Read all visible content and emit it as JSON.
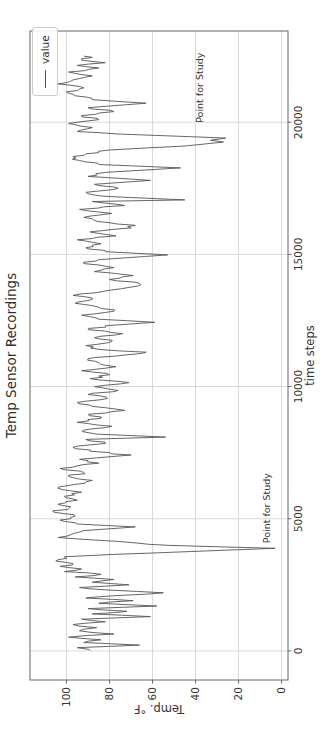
{
  "figure": {
    "background": "#ffffff"
  },
  "chart_data": {
    "type": "line",
    "title": "Temp Sensor Recordings",
    "xlabel": "time steps",
    "ylabel": "Temp. °F",
    "legend": {
      "label": "value",
      "position": "upper right"
    },
    "grid": true,
    "xlim": [
      -1100,
      23450
    ],
    "ylim": [
      -3,
      117
    ],
    "xticks": [
      0,
      5000,
      10000,
      15000,
      20000
    ],
    "yticks": [
      0,
      20,
      40,
      60,
      80,
      100
    ],
    "orientation": "figure rotated 90 degrees counterclockwise in screenshot",
    "colors": {
      "line": "#555555",
      "grid": "#d9d9d9",
      "spine": "#666666",
      "text": "#333333",
      "title": "#2f2f2f",
      "legend_border": "#cccccc"
    },
    "annotations": [
      {
        "label": "Point for Study",
        "t": 4000,
        "temp": 7
      },
      {
        "label": "Point for Study",
        "t": 19900,
        "temp": 38
      }
    ],
    "points_are_downsampled": true,
    "noise_amplitude": 3,
    "series": [
      {
        "name": "value",
        "points": [
          [
            0,
            89
          ],
          [
            120,
            95
          ],
          [
            220,
            66
          ],
          [
            320,
            92
          ],
          [
            420,
            84
          ],
          [
            520,
            99
          ],
          [
            640,
            78
          ],
          [
            760,
            94
          ],
          [
            880,
            86
          ],
          [
            1000,
            97
          ],
          [
            1100,
            82
          ],
          [
            1200,
            93
          ],
          [
            1300,
            61
          ],
          [
            1400,
            88
          ],
          [
            1500,
            72
          ],
          [
            1600,
            90
          ],
          [
            1700,
            58
          ],
          [
            1800,
            85
          ],
          [
            1900,
            69
          ],
          [
            2000,
            91
          ],
          [
            2100,
            75
          ],
          [
            2200,
            55
          ],
          [
            2300,
            80
          ],
          [
            2400,
            94
          ],
          [
            2500,
            71
          ],
          [
            2600,
            88
          ],
          [
            2700,
            78
          ],
          [
            2800,
            96
          ],
          [
            2900,
            84
          ],
          [
            3000,
            101
          ],
          [
            3100,
            93
          ],
          [
            3200,
            103
          ],
          [
            3300,
            97
          ],
          [
            3400,
            105
          ],
          [
            3500,
            100
          ],
          [
            3560,
            101
          ],
          [
            3650,
            78
          ],
          [
            3760,
            42
          ],
          [
            3880,
            3
          ],
          [
            3990,
            52
          ],
          [
            4080,
            67
          ],
          [
            4200,
            88
          ],
          [
            4290,
            104
          ],
          [
            4400,
            98
          ],
          [
            4550,
            92
          ],
          [
            4690,
            68
          ],
          [
            4800,
            95
          ],
          [
            4950,
            103
          ],
          [
            5100,
            96
          ],
          [
            5250,
            106
          ],
          [
            5400,
            99
          ],
          [
            5550,
            104
          ],
          [
            5700,
            95
          ],
          [
            5850,
            101
          ],
          [
            6000,
            93
          ],
          [
            6150,
            104
          ],
          [
            6300,
            96
          ],
          [
            6450,
            88
          ],
          [
            6600,
            99
          ],
          [
            6750,
            92
          ],
          [
            6900,
            103
          ],
          [
            7100,
            85
          ],
          [
            7250,
            94
          ],
          [
            7410,
            70
          ],
          [
            7550,
            89
          ],
          [
            7700,
            97
          ],
          [
            7850,
            82
          ],
          [
            8000,
            91
          ],
          [
            8090,
            54
          ],
          [
            8200,
            86
          ],
          [
            8350,
            92
          ],
          [
            8500,
            79
          ],
          [
            8650,
            95
          ],
          [
            8800,
            84
          ],
          [
            8950,
            90
          ],
          [
            9100,
            73
          ],
          [
            9250,
            88
          ],
          [
            9400,
            95
          ],
          [
            9550,
            81
          ],
          [
            9700,
            90
          ],
          [
            9850,
            76
          ],
          [
            10000,
            87
          ],
          [
            10150,
            71
          ],
          [
            10300,
            89
          ],
          [
            10450,
            80
          ],
          [
            10600,
            93
          ],
          [
            10750,
            77
          ],
          [
            10900,
            85
          ],
          [
            11050,
            90
          ],
          [
            11200,
            72
          ],
          [
            11300,
            63
          ],
          [
            11400,
            84
          ],
          [
            11550,
            91
          ],
          [
            11700,
            79
          ],
          [
            11850,
            87
          ],
          [
            12000,
            74
          ],
          [
            12150,
            90
          ],
          [
            12300,
            82
          ],
          [
            12430,
            59
          ],
          [
            12550,
            85
          ],
          [
            12700,
            93
          ],
          [
            12850,
            78
          ],
          [
            13000,
            85
          ],
          [
            13150,
            96
          ],
          [
            13300,
            88
          ],
          [
            13450,
            97
          ],
          [
            13600,
            83
          ],
          [
            13750,
            71
          ],
          [
            13900,
            66
          ],
          [
            14050,
            80
          ],
          [
            14200,
            69
          ],
          [
            14350,
            87
          ],
          [
            14500,
            78
          ],
          [
            14650,
            92
          ],
          [
            14800,
            85
          ],
          [
            14980,
            53
          ],
          [
            15100,
            82
          ],
          [
            15250,
            91
          ],
          [
            15400,
            84
          ],
          [
            15550,
            95
          ],
          [
            15700,
            77
          ],
          [
            15850,
            89
          ],
          [
            16000,
            70
          ],
          [
            16100,
            68
          ],
          [
            16250,
            86
          ],
          [
            16400,
            92
          ],
          [
            16550,
            79
          ],
          [
            16700,
            94
          ],
          [
            16850,
            73
          ],
          [
            17000,
            88
          ],
          [
            17060,
            45
          ],
          [
            17200,
            83
          ],
          [
            17350,
            91
          ],
          [
            17500,
            76
          ],
          [
            17650,
            87
          ],
          [
            17800,
            61
          ],
          [
            17950,
            90
          ],
          [
            18100,
            82
          ],
          [
            18270,
            47
          ],
          [
            18400,
            85
          ],
          [
            18550,
            94
          ],
          [
            18700,
            97
          ],
          [
            18800,
            91
          ],
          [
            18950,
            80
          ],
          [
            19100,
            45
          ],
          [
            19250,
            27
          ],
          [
            19320,
            33
          ],
          [
            19400,
            26
          ],
          [
            19550,
            75
          ],
          [
            19650,
            95
          ],
          [
            19800,
            88
          ],
          [
            19950,
            99
          ],
          [
            20100,
            85
          ],
          [
            20250,
            93
          ],
          [
            20400,
            78
          ],
          [
            20550,
            90
          ],
          [
            20720,
            63
          ],
          [
            20850,
            88
          ],
          [
            21000,
            96
          ],
          [
            21150,
            100
          ],
          [
            21300,
            92
          ],
          [
            21450,
            104
          ],
          [
            21600,
            97
          ],
          [
            21750,
            88
          ],
          [
            21900,
            99
          ],
          [
            22050,
            85
          ],
          [
            22150,
            95
          ],
          [
            22250,
            82
          ],
          [
            22350,
            93
          ],
          [
            22450,
            88
          ],
          [
            22500,
            92
          ]
        ]
      }
    ]
  }
}
